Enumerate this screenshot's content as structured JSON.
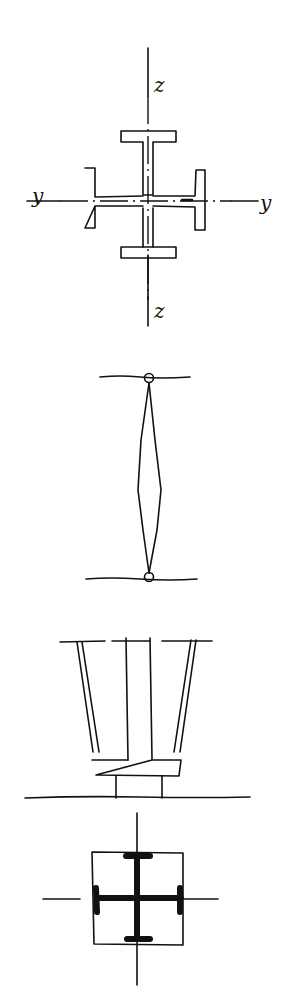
{
  "figures": [
    {
      "id": "cross-section",
      "description": "Cruciform built-up column section of four I-shapes with axes",
      "labels": {
        "z_top": "z",
        "z_bottom": "z",
        "y_left": "y",
        "y_right": "y"
      }
    },
    {
      "id": "pinned-column",
      "description": "Pin-ended column between two lines, lens-shaped (spindle) profile"
    },
    {
      "id": "column-base",
      "description": "Tapered column legs resting on base plate and pedestal on ground line"
    },
    {
      "id": "encased-section",
      "description": "Cruciform steel section (bold) within square outline and axis lines"
    }
  ],
  "colors": {
    "ink": "#111111",
    "paper": "#ffffff"
  }
}
